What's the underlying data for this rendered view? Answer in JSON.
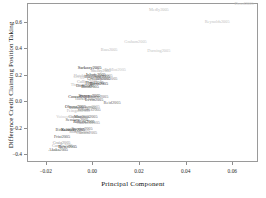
{
  "chart_data": {
    "type": "scatter",
    "title": "",
    "xlabel": "Principal Component",
    "ylabel": "Difference Credit Claiming Position Taking",
    "xlim": [
      -0.028,
      0.071
    ],
    "ylim": [
      -0.46,
      0.74
    ],
    "xticks": [
      -0.02,
      0.0,
      0.02,
      0.04,
      0.06
    ],
    "xticklabels": [
      "−0.02",
      "0.00",
      "0.02",
      "0.04",
      "0.06"
    ],
    "yticks": [
      -0.4,
      -0.2,
      0.0,
      0.2,
      0.4,
      0.6
    ],
    "yticklabels": [
      "−0.4",
      "−0.2",
      "0.0",
      "0.2",
      "0.4",
      "0.6"
    ],
    "grid": false,
    "legend": null,
    "marker": "text-label",
    "note": "Each observation is drawn as its text label (legislator name + year) rather than a point marker.",
    "points": [
      {
        "label": "Dowd2005",
        "x": 0.065,
        "y": 0.73,
        "size": 4.3,
        "shade": "#c9c9c9"
      },
      {
        "label": "Medly2005",
        "x": 0.0285,
        "y": 0.69,
        "size": 4.3,
        "shade": "#bdbdbd"
      },
      {
        "label": "Reynolds2005",
        "x": 0.0535,
        "y": 0.6,
        "size": 4.3,
        "shade": "#c2c2c2"
      },
      {
        "label": "Graham2005",
        "x": 0.0185,
        "y": 0.445,
        "size": 4.3,
        "shade": "#c4c4c4"
      },
      {
        "label": "Bass2005",
        "x": 0.0072,
        "y": 0.385,
        "size": 4.3,
        "shade": "#bcbcbc"
      },
      {
        "label": "Durning2005",
        "x": 0.0285,
        "y": 0.38,
        "size": 4.3,
        "shade": "#c4c4c4"
      },
      {
        "label": "Sarkozy2005",
        "x": -0.0012,
        "y": 0.25,
        "size": 4.5,
        "shade": "#1e1e1e"
      },
      {
        "label": "DeMint2005",
        "x": 0.0098,
        "y": 0.232,
        "size": 4.2,
        "shade": "#c0c0c0"
      },
      {
        "label": "Shelby2005",
        "x": 0.0036,
        "y": 0.228,
        "size": 4.2,
        "shade": "#9c9c9c"
      },
      {
        "label": "Hutchison2005",
        "x": -0.0025,
        "y": 0.19,
        "size": 4.2,
        "shade": "#b5b5b5"
      },
      {
        "label": "Inhofe2005",
        "x": 0.0015,
        "y": 0.196,
        "size": 4.3,
        "shade": "#3a3a3a"
      },
      {
        "label": "Lugar2005",
        "x": 0.0048,
        "y": 0.19,
        "size": 4.2,
        "shade": "#8f8f8f"
      },
      {
        "label": "Bingaman2005",
        "x": 0.002,
        "y": 0.178,
        "size": 4.2,
        "shade": "#4d4d4d"
      },
      {
        "label": "Gregg2005",
        "x": -0.004,
        "y": 0.182,
        "size": 4.2,
        "shade": "#c3c3c3"
      },
      {
        "label": "Grassley2005",
        "x": 0.0028,
        "y": 0.166,
        "size": 4.2,
        "shade": "#5f5f5f"
      },
      {
        "label": "Johnson2005",
        "x": 0.006,
        "y": 0.17,
        "size": 4.2,
        "shade": "#7a7a7a"
      },
      {
        "label": "Collins2005",
        "x": -0.0022,
        "y": 0.142,
        "size": 4.2,
        "shade": "#9e9e9e"
      },
      {
        "label": "Hagel2005",
        "x": 0.001,
        "y": 0.134,
        "size": 4.2,
        "shade": "#555555"
      },
      {
        "label": "Burns2005",
        "x": 0.0028,
        "y": 0.13,
        "size": 4.2,
        "shade": "#2e2e2e"
      },
      {
        "label": "Thomas2005",
        "x": -0.0046,
        "y": 0.122,
        "size": 4.2,
        "shade": "#bcbcbc"
      },
      {
        "label": "Dodd2005",
        "x": -0.0032,
        "y": 0.11,
        "size": 4.2,
        "shade": "#5c5c5c"
      },
      {
        "label": "Bond2005",
        "x": -0.001,
        "y": 0.104,
        "size": 4.2,
        "shade": "#3f3f3f"
      },
      {
        "label": "Conrad2005",
        "x": -0.0058,
        "y": 0.03,
        "size": 4.3,
        "shade": "#2a2a2a"
      },
      {
        "label": "Stevens2005",
        "x": -0.0012,
        "y": 0.036,
        "size": 4.3,
        "shade": "#303030"
      },
      {
        "label": "Salazar2005",
        "x": 0.0024,
        "y": 0.028,
        "size": 4.2,
        "shade": "#6d6d6d"
      },
      {
        "label": "Harkin2005",
        "x": -0.003,
        "y": 0.018,
        "size": 4.2,
        "shade": "#888888"
      },
      {
        "label": "Levin2005",
        "x": 0.0008,
        "y": 0.01,
        "size": 4.2,
        "shade": "#4a4a4a"
      },
      {
        "label": "Reid2005",
        "x": 0.0085,
        "y": -0.012,
        "size": 4.4,
        "shade": "#6a6a6a"
      },
      {
        "label": "Obama2005",
        "x": -0.0072,
        "y": -0.048,
        "size": 4.3,
        "shade": "#303030"
      },
      {
        "label": "Coleman2005",
        "x": -0.0018,
        "y": -0.044,
        "size": 4.2,
        "shade": "#9a9a9a"
      },
      {
        "label": "Lautenberg2005",
        "x": -0.004,
        "y": -0.05,
        "size": 4.2,
        "shade": "#7d7d7d"
      },
      {
        "label": "Feingold2005",
        "x": -0.006,
        "y": -0.074,
        "size": 4.2,
        "shade": "#b2b2b2"
      },
      {
        "label": "Schumer2005",
        "x": -0.0014,
        "y": -0.07,
        "size": 4.2,
        "shade": "#707070"
      },
      {
        "label": "Voinovich2005",
        "x": -0.01,
        "y": -0.124,
        "size": 4.2,
        "shade": "#c6c6c6"
      },
      {
        "label": "Corzine2005",
        "x": -0.0056,
        "y": -0.118,
        "size": 4.2,
        "shade": "#7c7c7c"
      },
      {
        "label": "Martinez2005",
        "x": -0.0028,
        "y": -0.122,
        "size": 4.2,
        "shade": "#606060"
      },
      {
        "label": "Sessions2005",
        "x": -0.0066,
        "y": -0.146,
        "size": 4.2,
        "shade": "#4f4f4f"
      },
      {
        "label": "Roberts2005",
        "x": -0.0036,
        "y": -0.16,
        "size": 4.2,
        "shade": "#1c1c1c"
      },
      {
        "label": "Cantwell2005",
        "x": -0.0018,
        "y": -0.168,
        "size": 4.2,
        "shade": "#8a8a8a"
      },
      {
        "label": "Biden2005",
        "x": -0.0118,
        "y": -0.216,
        "size": 4.2,
        "shade": "#5a5a5a"
      },
      {
        "label": "Kennedy2005",
        "x": -0.0082,
        "y": -0.222,
        "size": 4.3,
        "shade": "#1a1a1a"
      },
      {
        "label": "Specter2005",
        "x": -0.0044,
        "y": -0.214,
        "size": 4.2,
        "shade": "#6b6b6b"
      },
      {
        "label": "Murray2005",
        "x": -0.0054,
        "y": -0.236,
        "size": 4.2,
        "shade": "#9b9b9b"
      },
      {
        "label": "Clinton2005",
        "x": -0.0024,
        "y": -0.238,
        "size": 4.2,
        "shade": "#828282"
      },
      {
        "label": "Frist2005",
        "x": -0.013,
        "y": -0.268,
        "size": 4.2,
        "shade": "#4c4c4c"
      },
      {
        "label": "Craig2005",
        "x": -0.0132,
        "y": -0.318,
        "size": 4.2,
        "shade": "#8e8e8e"
      },
      {
        "label": "Cornyn2005",
        "x": -0.0128,
        "y": -0.336,
        "size": 4.2,
        "shade": "#a0a0a0"
      },
      {
        "label": "Boxer2005",
        "x": -0.0106,
        "y": -0.344,
        "size": 4.2,
        "shade": "#2d2d2d"
      },
      {
        "label": "Akaka2005",
        "x": -0.0146,
        "y": -0.372,
        "size": 4.2,
        "shade": "#4a4a4a"
      }
    ]
  },
  "axis": {
    "x_title": "Principal Component",
    "y_title": "Difference Credit Claiming Position Taking"
  }
}
